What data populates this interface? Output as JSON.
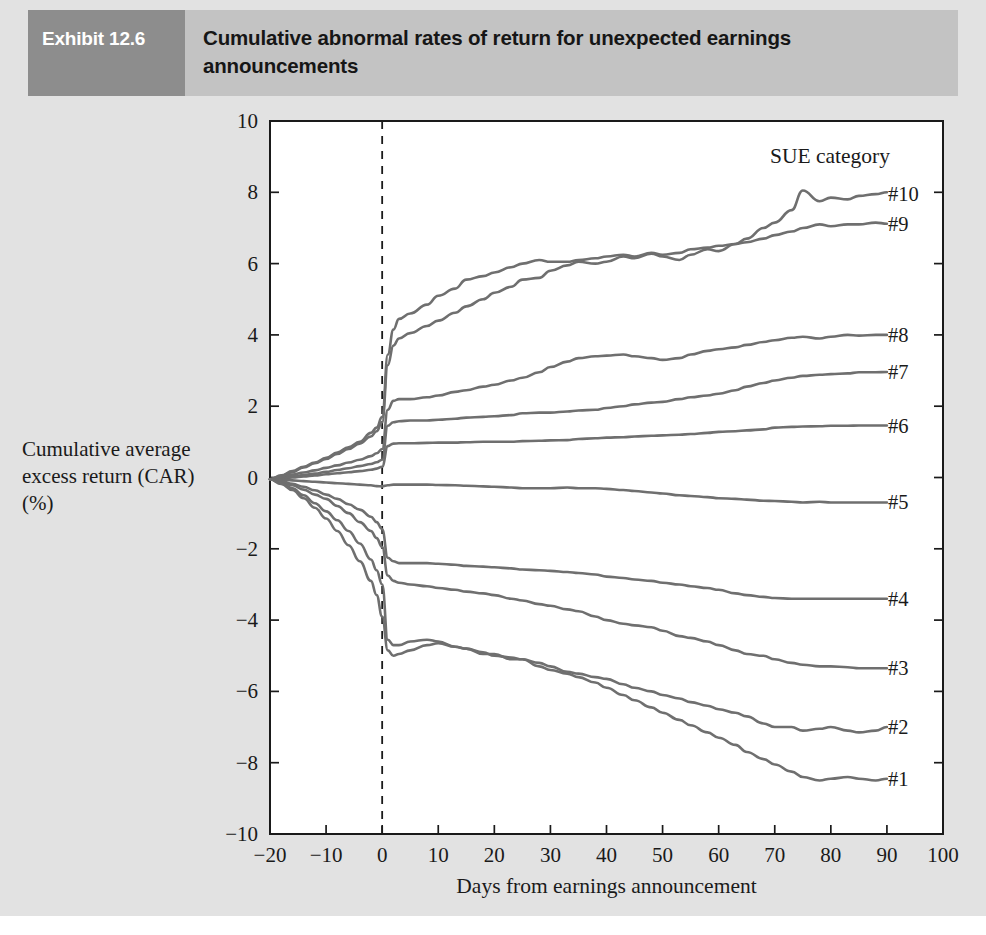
{
  "header": {
    "tag": "Exhibit 12.6",
    "title": "Cumulative abnormal rates of return for unexpected earnings announcements",
    "tag_bg": "#8d8d8d",
    "band_bg": "#c3c3c3",
    "tag_color": "#ffffff"
  },
  "colors": {
    "panel_bg": "#e2e2e2",
    "plot_bg": "#ffffff",
    "axis": "#1a1a1a",
    "series": "#6f6f6f"
  },
  "chart_data": {
    "type": "line",
    "title": "Cumulative abnormal rates of return for unexpected earnings announcements",
    "xlabel": "Days from earnings announcement",
    "ylabel": "Cumulative average excess return (CAR) (%)",
    "ylabel_lines": [
      "Cumulative average",
      "excess return (CAR)",
      "(%)"
    ],
    "legend_title": "SUE category",
    "legend_position": "right-of-line-ends",
    "grid": false,
    "xlim": [
      -20,
      100
    ],
    "ylim": [
      -10,
      10
    ],
    "xticks": [
      -20,
      -10,
      0,
      10,
      20,
      30,
      40,
      50,
      60,
      70,
      80,
      90,
      100
    ],
    "yticks": [
      -10,
      -8,
      -6,
      -4,
      -2,
      0,
      2,
      4,
      6,
      8,
      10
    ],
    "annotations": [
      {
        "type": "vline",
        "x": 0,
        "style": "dashed",
        "label": "announcement day"
      }
    ],
    "x": [
      -20,
      -18,
      -16,
      -14,
      -12,
      -10,
      -8,
      -6,
      -4,
      -2,
      -1,
      0,
      1,
      2,
      3,
      5,
      8,
      10,
      13,
      15,
      18,
      20,
      23,
      25,
      28,
      30,
      33,
      35,
      38,
      40,
      43,
      45,
      48,
      50,
      53,
      55,
      58,
      60,
      63,
      65,
      68,
      70,
      73,
      75,
      78,
      80,
      83,
      85,
      88,
      90
    ],
    "series": [
      {
        "name": "#10",
        "label": "#10",
        "label_y": 7.95,
        "values": [
          -0.05,
          0.05,
          0.15,
          0.28,
          0.4,
          0.52,
          0.66,
          0.8,
          0.95,
          1.15,
          1.3,
          1.55,
          3.15,
          3.7,
          3.9,
          4.05,
          4.25,
          4.4,
          4.62,
          4.8,
          5.0,
          5.18,
          5.35,
          5.55,
          5.6,
          5.8,
          5.95,
          6.05,
          6.0,
          6.05,
          6.2,
          6.15,
          6.28,
          6.2,
          6.1,
          6.25,
          6.4,
          6.35,
          6.55,
          6.7,
          7.0,
          7.15,
          7.5,
          8.05,
          7.75,
          7.85,
          7.8,
          7.9,
          7.95,
          8.0
        ]
      },
      {
        "name": "#9",
        "label": "#9",
        "label_y": 7.1,
        "values": [
          -0.05,
          0.06,
          0.18,
          0.3,
          0.42,
          0.55,
          0.7,
          0.85,
          1.0,
          1.25,
          1.4,
          1.7,
          3.45,
          4.15,
          4.45,
          4.6,
          4.85,
          5.1,
          5.3,
          5.55,
          5.65,
          5.75,
          5.9,
          6.0,
          6.1,
          6.05,
          6.05,
          6.1,
          6.15,
          6.2,
          6.25,
          6.2,
          6.3,
          6.25,
          6.3,
          6.4,
          6.45,
          6.5,
          6.55,
          6.6,
          6.7,
          6.8,
          6.9,
          7.0,
          7.1,
          7.05,
          7.1,
          7.1,
          7.15,
          7.12
        ]
      },
      {
        "name": "#8",
        "label": "#8",
        "label_y": 4.0,
        "values": [
          -0.05,
          0.02,
          0.08,
          0.14,
          0.2,
          0.27,
          0.34,
          0.42,
          0.5,
          0.6,
          0.68,
          0.8,
          1.9,
          2.15,
          2.2,
          2.2,
          2.25,
          2.3,
          2.4,
          2.45,
          2.55,
          2.6,
          2.72,
          2.8,
          2.95,
          3.1,
          3.25,
          3.35,
          3.4,
          3.42,
          3.45,
          3.4,
          3.35,
          3.3,
          3.35,
          3.45,
          3.55,
          3.6,
          3.65,
          3.72,
          3.8,
          3.85,
          3.92,
          3.95,
          3.9,
          3.95,
          4.0,
          3.98,
          4.0,
          4.0
        ]
      },
      {
        "name": "#7",
        "label": "#7",
        "label_y": 2.95,
        "values": [
          -0.05,
          -0.01,
          0.03,
          0.07,
          0.11,
          0.16,
          0.21,
          0.26,
          0.32,
          0.38,
          0.43,
          0.5,
          1.45,
          1.55,
          1.58,
          1.6,
          1.6,
          1.62,
          1.65,
          1.68,
          1.7,
          1.72,
          1.75,
          1.8,
          1.82,
          1.82,
          1.85,
          1.88,
          1.9,
          1.95,
          2.0,
          2.05,
          2.1,
          2.12,
          2.2,
          2.25,
          2.3,
          2.35,
          2.45,
          2.55,
          2.65,
          2.72,
          2.8,
          2.85,
          2.88,
          2.9,
          2.92,
          2.95,
          2.95,
          2.96
        ]
      },
      {
        "name": "#6",
        "label": "#6",
        "label_y": 1.45,
        "values": [
          -0.05,
          -0.03,
          0.0,
          0.03,
          0.06,
          0.09,
          0.12,
          0.15,
          0.18,
          0.22,
          0.25,
          0.3,
          0.88,
          0.95,
          0.96,
          0.96,
          0.97,
          0.98,
          0.98,
          0.99,
          1.0,
          1.0,
          1.0,
          1.02,
          1.03,
          1.04,
          1.05,
          1.08,
          1.1,
          1.12,
          1.13,
          1.15,
          1.17,
          1.18,
          1.2,
          1.22,
          1.25,
          1.28,
          1.3,
          1.32,
          1.35,
          1.4,
          1.42,
          1.43,
          1.44,
          1.45,
          1.45,
          1.46,
          1.46,
          1.46
        ]
      },
      {
        "name": "#5",
        "label": "#5",
        "label_y": -0.7,
        "values": [
          -0.05,
          -0.06,
          -0.08,
          -0.1,
          -0.12,
          -0.14,
          -0.16,
          -0.18,
          -0.2,
          -0.22,
          -0.24,
          -0.25,
          -0.22,
          -0.2,
          -0.2,
          -0.2,
          -0.2,
          -0.21,
          -0.22,
          -0.23,
          -0.25,
          -0.26,
          -0.28,
          -0.3,
          -0.3,
          -0.3,
          -0.28,
          -0.3,
          -0.3,
          -0.32,
          -0.35,
          -0.38,
          -0.42,
          -0.45,
          -0.5,
          -0.52,
          -0.55,
          -0.58,
          -0.6,
          -0.62,
          -0.65,
          -0.66,
          -0.68,
          -0.7,
          -0.68,
          -0.7,
          -0.7,
          -0.7,
          -0.7,
          -0.7
        ]
      },
      {
        "name": "#4",
        "label": "#4",
        "label_y": -3.4,
        "values": [
          -0.05,
          -0.1,
          -0.18,
          -0.26,
          -0.36,
          -0.48,
          -0.6,
          -0.75,
          -0.9,
          -1.1,
          -1.25,
          -1.45,
          -2.25,
          -2.35,
          -2.4,
          -2.4,
          -2.4,
          -2.42,
          -2.45,
          -2.48,
          -2.5,
          -2.52,
          -2.55,
          -2.58,
          -2.6,
          -2.62,
          -2.65,
          -2.68,
          -2.72,
          -2.78,
          -2.82,
          -2.86,
          -2.9,
          -2.95,
          -3.0,
          -3.05,
          -3.1,
          -3.15,
          -3.25,
          -3.3,
          -3.35,
          -3.38,
          -3.4,
          -3.4,
          -3.4,
          -3.4,
          -3.4,
          -3.4,
          -3.4,
          -3.4
        ]
      },
      {
        "name": "#3",
        "label": "#3",
        "label_y": -5.35,
        "values": [
          -0.05,
          -0.12,
          -0.22,
          -0.34,
          -0.48,
          -0.6,
          -0.8,
          -1.0,
          -1.25,
          -1.5,
          -1.7,
          -1.95,
          -2.75,
          -2.9,
          -2.95,
          -3.0,
          -3.05,
          -3.1,
          -3.15,
          -3.2,
          -3.25,
          -3.3,
          -3.4,
          -3.45,
          -3.55,
          -3.6,
          -3.7,
          -3.75,
          -3.9,
          -4.0,
          -4.1,
          -4.15,
          -4.2,
          -4.3,
          -4.45,
          -4.5,
          -4.6,
          -4.7,
          -4.85,
          -4.95,
          -5.0,
          -5.1,
          -5.2,
          -5.25,
          -5.3,
          -5.3,
          -5.32,
          -5.35,
          -5.35,
          -5.35
        ]
      },
      {
        "name": "#2",
        "label": "#2",
        "label_y": -7.0,
        "values": [
          -0.05,
          -0.15,
          -0.3,
          -0.5,
          -0.72,
          -0.95,
          -1.2,
          -1.5,
          -1.85,
          -2.3,
          -2.6,
          -3.0,
          -4.55,
          -4.7,
          -4.7,
          -4.6,
          -4.55,
          -4.6,
          -4.75,
          -4.8,
          -4.9,
          -5.0,
          -5.05,
          -5.1,
          -5.2,
          -5.3,
          -5.45,
          -5.5,
          -5.6,
          -5.65,
          -5.8,
          -5.9,
          -6.0,
          -6.1,
          -6.2,
          -6.3,
          -6.4,
          -6.5,
          -6.6,
          -6.7,
          -6.9,
          -7.0,
          -7.0,
          -7.1,
          -7.05,
          -7.0,
          -7.1,
          -7.15,
          -7.1,
          -7.0
        ]
      },
      {
        "name": "#1",
        "label": "#1",
        "label_y": -8.45,
        "values": [
          -0.05,
          -0.18,
          -0.35,
          -0.58,
          -0.85,
          -1.15,
          -1.5,
          -1.9,
          -2.35,
          -2.9,
          -3.3,
          -3.9,
          -4.85,
          -5.0,
          -4.95,
          -4.85,
          -4.7,
          -4.65,
          -4.75,
          -4.8,
          -4.95,
          -4.95,
          -5.1,
          -5.1,
          -5.3,
          -5.4,
          -5.5,
          -5.6,
          -5.75,
          -5.9,
          -6.1,
          -6.25,
          -6.45,
          -6.6,
          -6.8,
          -6.95,
          -7.15,
          -7.3,
          -7.5,
          -7.7,
          -7.9,
          -8.05,
          -8.25,
          -8.4,
          -8.5,
          -8.45,
          -8.4,
          -8.45,
          -8.5,
          -8.45
        ]
      }
    ]
  }
}
